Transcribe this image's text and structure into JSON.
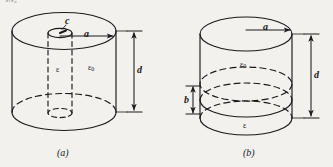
{
  "figure": {
    "background_color": "#f2f1ee",
    "ink_color": "#1a1a1a",
    "top_fragment": "ε/ε₀",
    "panels": [
      {
        "id": "a",
        "caption": "(a)",
        "description": "Cylinder of outer radius a and height d filled with permittivity ε₀, containing a coaxial inner cylinder of radius c filled with permittivity ε",
        "labels": {
          "inner_radius": "c",
          "outer_radius": "a",
          "height": "d",
          "inner_medium": "ε",
          "outer_medium": "ε",
          "outer_medium_sub": "0"
        }
      },
      {
        "id": "b",
        "caption": "(b)",
        "description": "Cylinder of radius a and height d with a lower slab of thickness b of permittivity ε and an upper region of permittivity ε₀",
        "labels": {
          "radius": "a",
          "height": "d",
          "slab_thickness": "b",
          "upper_medium": "ε",
          "upper_medium_sub": "0",
          "lower_medium": "ε"
        }
      }
    ]
  }
}
